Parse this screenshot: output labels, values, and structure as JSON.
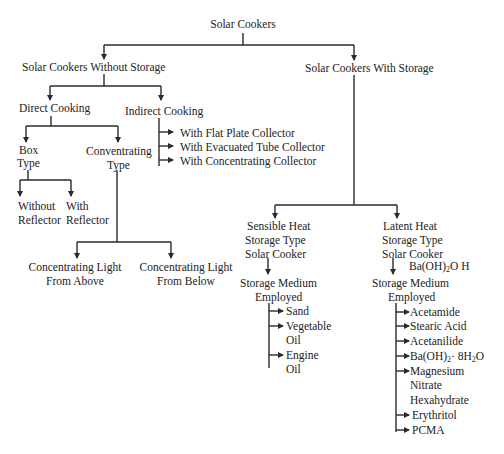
{
  "diagram": {
    "root": "Solar Cookers",
    "without_storage": {
      "label": "Solar Cookers Without Storage",
      "direct": {
        "label": "Direct Cooking",
        "box_type": {
          "line1": "Box",
          "line2": "Type",
          "children": [
            {
              "line1": "Without",
              "line2": "Reflector"
            },
            {
              "line1": "With",
              "line2": "Reflector"
            }
          ]
        },
        "concentrating_type": {
          "line1": "Conventrating",
          "line2": "Type",
          "children": [
            {
              "line1": "Concentrating Light",
              "line2": "From Above"
            },
            {
              "line1": "Concentrating Light",
              "line2": "From Below"
            }
          ]
        }
      },
      "indirect": {
        "label": "Indirect Cooking",
        "items": [
          "With Flat Plate Collector",
          "With Evacuated Tube Collector",
          "With Concentrating Collector"
        ]
      }
    },
    "with_storage": {
      "label": "Solar Cookers With Storage",
      "sensible": {
        "line1": "Sensible Heat",
        "line2": "Storage Type",
        "line3": "Solar Cooker",
        "medium_line1": "Storage Medium",
        "medium_line2": "Employed",
        "items": [
          "Sand",
          "Vegetable",
          "Oil",
          "Engine",
          "Oil"
        ]
      },
      "latent": {
        "line1": "Latent Heat",
        "line2": "Storage Type",
        "line3": "Solar Cooker",
        "stray_label": "Ba(OH)2O H",
        "medium_line1": "Storage Medium",
        "medium_line2": "Employed",
        "items": [
          "Acetamide",
          "Stearic Acid",
          "Acetanilide",
          "Ba(OH)2· 8H2O",
          "Magnesium",
          "Nitrate",
          "Hexahydrate",
          "Erythritol",
          "PCMA"
        ]
      }
    }
  },
  "colors": {
    "line": "#2a2a2a",
    "text": "#222222",
    "background": "#ffffff"
  }
}
